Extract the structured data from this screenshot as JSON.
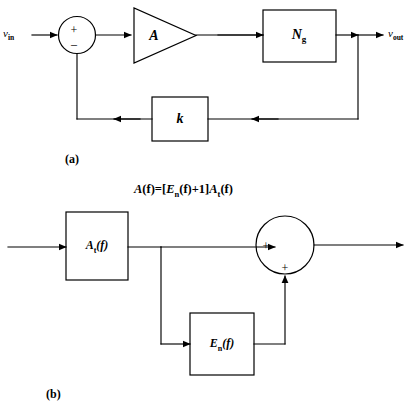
{
  "figure": {
    "background_color": "#ffffff",
    "stroke_color": "#000000",
    "panels": [
      {
        "id": "panel-a",
        "caption": "(a)",
        "kind": "feedback-block-diagram",
        "description": "Closed-loop feedback amplifier with noise generator and feedback factor k"
      },
      {
        "id": "panel-b",
        "caption": "(b)",
        "kind": "equivalent-block-diagram",
        "description": "Equivalent representation of the amplifier transfer function with additive error term"
      }
    ]
  },
  "panel_a": {
    "caption": "(a)",
    "input_label": {
      "base": "v",
      "sub": "in"
    },
    "output_label": {
      "base": "v",
      "sub": "out"
    },
    "summing_junction": {
      "name": "summing-junction",
      "signs": [
        {
          "label": "+",
          "port": "input-left"
        },
        {
          "label": "–",
          "port": "feedback-bottom"
        }
      ]
    },
    "amplifier": {
      "shape": "triangle",
      "label": "A"
    },
    "noise_block": {
      "shape": "rectangle",
      "label_base": "N",
      "label_sub": "g"
    },
    "feedback_block": {
      "shape": "rectangle",
      "label": "k"
    }
  },
  "panel_b": {
    "caption": "(b)",
    "equation": {
      "lhs_base": "A",
      "lhs_arg": "(f)",
      "equals": "=",
      "open_bracket": "[",
      "term1_base": "E",
      "term1_sub": "n",
      "term1_arg": "(f)",
      "plus": "+",
      "one": "1",
      "close_bracket": "]",
      "term2_base": "A",
      "term2_sub": "t",
      "term2_arg": "(f)",
      "plain": "A(f) = [Eₙ(f) + 1]Aₜ(f)"
    },
    "forward_block": {
      "shape": "rectangle",
      "label_base": "A",
      "label_sub": "t",
      "label_arg": "(f)"
    },
    "error_block": {
      "shape": "rectangle",
      "label_base": "E",
      "label_sub": "n",
      "label_arg": "(f)"
    },
    "summing_junction": {
      "name": "summing-junction",
      "signs": [
        {
          "label": "+",
          "port": "input-left"
        },
        {
          "label": "+",
          "port": "input-bottom"
        }
      ]
    }
  }
}
